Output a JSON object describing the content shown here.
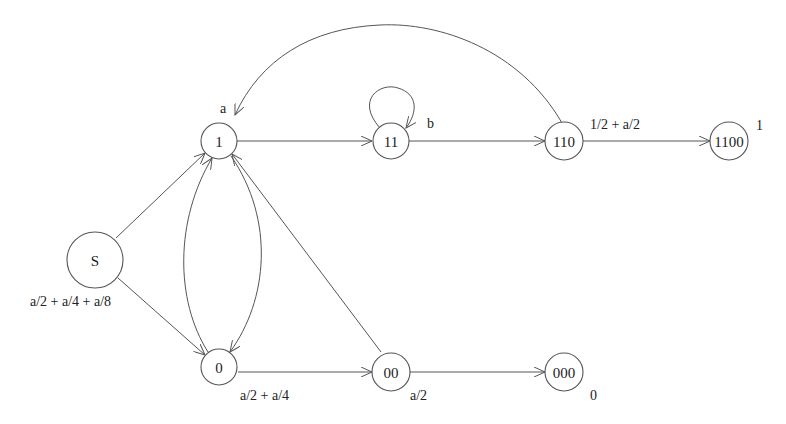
{
  "diagram": {
    "type": "state-transition-graph",
    "nodes": [
      {
        "id": "S",
        "label": "S",
        "annotation": "a/2 + a/4 + a/8"
      },
      {
        "id": "1",
        "label": "1",
        "annotation": "a"
      },
      {
        "id": "11",
        "label": "11",
        "annotation": "b"
      },
      {
        "id": "110",
        "label": "110",
        "annotation": "1/2 + a/2"
      },
      {
        "id": "1100",
        "label": "1100",
        "annotation": "1"
      },
      {
        "id": "0",
        "label": "0",
        "annotation": "a/2 + a/4"
      },
      {
        "id": "00",
        "label": "00",
        "annotation": "a/2"
      },
      {
        "id": "000",
        "label": "000",
        "annotation": "0"
      }
    ],
    "edges": [
      {
        "from": "S",
        "to": "1"
      },
      {
        "from": "S",
        "to": "0"
      },
      {
        "from": "1",
        "to": "11"
      },
      {
        "from": "1",
        "to": "0"
      },
      {
        "from": "0",
        "to": "1"
      },
      {
        "from": "11",
        "to": "11"
      },
      {
        "from": "11",
        "to": "110"
      },
      {
        "from": "110",
        "to": "1"
      },
      {
        "from": "110",
        "to": "1100"
      },
      {
        "from": "0",
        "to": "00"
      },
      {
        "from": "00",
        "to": "1"
      },
      {
        "from": "00",
        "to": "000"
      }
    ]
  }
}
